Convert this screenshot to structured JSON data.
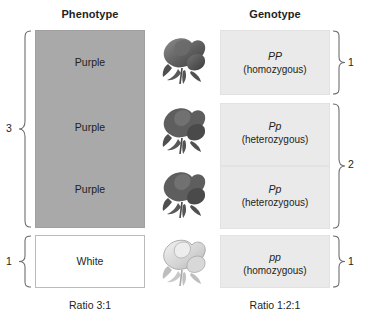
{
  "headers": {
    "phenotype": "Phenotype",
    "genotype": "Genotype"
  },
  "phenotype": {
    "rows": [
      {
        "label": "Purple",
        "color": "#a9a9a9"
      },
      {
        "label": "Purple",
        "color": "#a9a9a9"
      },
      {
        "label": "Purple",
        "color": "#a9a9a9"
      },
      {
        "label": "White",
        "color": "#ffffff"
      }
    ],
    "bracket_counts": {
      "purple": "3",
      "white": "1"
    },
    "ratio": "Ratio 3:1"
  },
  "genotype": {
    "rows": [
      {
        "allele": "PP",
        "zygosity": "(homozygous)"
      },
      {
        "allele": "Pp",
        "zygosity": "(heterozygous)"
      },
      {
        "allele": "Pp",
        "zygosity": "(heterozygous)"
      },
      {
        "allele": "pp",
        "zygosity": "(homozygous)"
      }
    ],
    "bracket_counts": {
      "dominant": "1",
      "hetero": "2",
      "recessive": "1"
    },
    "ratio": "Ratio 1:2:1"
  },
  "flowers": [
    {
      "name": "rose-dark",
      "shade": "dark"
    },
    {
      "name": "rose-dark",
      "shade": "dark"
    },
    {
      "name": "rose-dark",
      "shade": "dark"
    },
    {
      "name": "rose-light",
      "shade": "light"
    }
  ],
  "colors": {
    "purple_box": "#a9a9a9",
    "white_box": "#ffffff",
    "genotype_box": "#eaeaea",
    "bracket": "#6d6e71",
    "text": "#231f20"
  }
}
